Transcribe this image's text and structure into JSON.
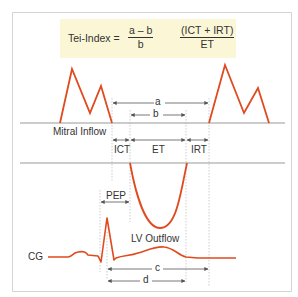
{
  "formula": {
    "lhs": "Tei-Index =",
    "frac1": {
      "numerator": "a – b",
      "denominator": "b"
    },
    "frac2": {
      "numerator": "(ICT + IRT)",
      "denominator": "ET"
    }
  },
  "labels": {
    "mitral_inflow": "Mitral Inflow",
    "a": "a",
    "b": "b",
    "ict": "ICT",
    "et": "ET",
    "irt": "IRT",
    "pep": "PEP",
    "lv_outflow": "LV Outflow",
    "cg": "CG",
    "c": "c",
    "d": "d"
  },
  "colors": {
    "waveform": "#e04a1f",
    "formula_bg": "#fbf7d6",
    "baseline": "#9a9a9a",
    "text": "#333333"
  }
}
